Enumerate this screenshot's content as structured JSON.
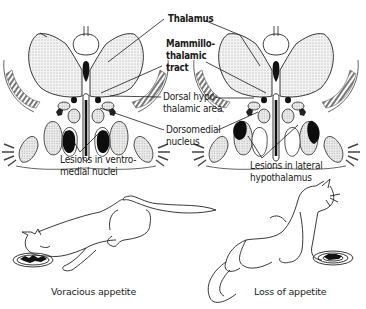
{
  "diagram": {
    "labels": {
      "thalamus": "Thalamus",
      "mammillothalamic_1": "Mammillo-",
      "mammillothalamic_2": "thalamic",
      "mammillothalamic_3": "tract",
      "dorsal_hypo_1": "Dorsal hypo-",
      "dorsal_hypo_2": "thalamic area",
      "dorsomedial_1": "Dorsomedial",
      "dorsomedial_2": "nucleus"
    },
    "left_section": {
      "caption_1": "Lesions in ventro-",
      "caption_2": "medial nuclei"
    },
    "right_section": {
      "caption_1": "Lesions in lateral",
      "caption_2": "hypothalamus"
    },
    "cats": {
      "left_caption": "Voracious appetite",
      "right_caption": "Loss of appetite"
    },
    "colors": {
      "line": "#1a1a1a",
      "stipple": "#c8c8c8",
      "lesion": "#111111",
      "background": "#ffffff"
    }
  }
}
